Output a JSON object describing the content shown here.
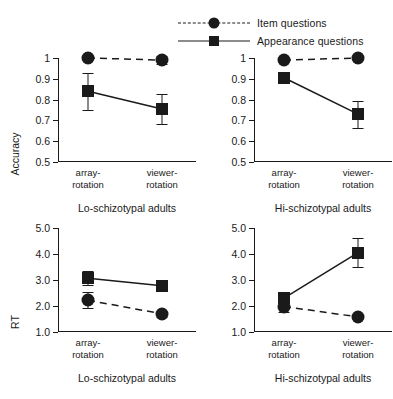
{
  "legend": {
    "position": "top-center",
    "entries": [
      {
        "label": "Item questions",
        "marker": "circle",
        "line": "dashed"
      },
      {
        "label": "Appearance questions",
        "marker": "square",
        "line": "solid"
      }
    ]
  },
  "colors": {
    "ink": "#1a1a1a",
    "background": "#ffffff"
  },
  "chart_data": [
    {
      "type": "line",
      "panel": "top-left",
      "title": "Lo-schizotypal adults",
      "xlabel": "",
      "ylabel": "Accuracy",
      "categories": [
        "array-rotation",
        "viewer-rotation"
      ],
      "ylim": [
        0.5,
        1.0
      ],
      "yticks": [
        "0.5",
        "0.6",
        "0.7",
        "0.8",
        "0.9",
        "1"
      ],
      "grid": false,
      "series": [
        {
          "name": "Item questions",
          "marker": "circle",
          "line": "dashed",
          "values": [
            1.0,
            0.99
          ],
          "errors": [
            0.01,
            0.02
          ]
        },
        {
          "name": "Appearance questions",
          "marker": "square",
          "line": "solid",
          "values": [
            0.84,
            0.755
          ],
          "errors": [
            0.09,
            0.07
          ]
        }
      ]
    },
    {
      "type": "line",
      "panel": "top-right",
      "title": "Hi-schizotypal adults",
      "xlabel": "",
      "ylabel": "",
      "categories": [
        "array-rotation",
        "viewer-rotation"
      ],
      "ylim": [
        0.5,
        1.0
      ],
      "yticks": [
        "0.5",
        "0.6",
        "0.7",
        "0.8",
        "0.9",
        "1"
      ],
      "grid": false,
      "series": [
        {
          "name": "Item questions",
          "marker": "circle",
          "line": "dashed",
          "values": [
            0.99,
            1.0
          ],
          "errors": [
            0.01,
            0.01
          ]
        },
        {
          "name": "Appearance questions",
          "marker": "square",
          "line": "solid",
          "values": [
            0.905,
            0.73
          ],
          "errors": [
            0.015,
            0.065
          ]
        }
      ]
    },
    {
      "type": "line",
      "panel": "bottom-left",
      "title": "Lo-schizotypal adults",
      "xlabel": "",
      "ylabel": "RT",
      "categories": [
        "array-rotation",
        "viewer-rotation"
      ],
      "ylim": [
        1.0,
        5.0
      ],
      "yticks": [
        "1.0",
        "2.0",
        "3.0",
        "4.0",
        "5.0"
      ],
      "grid": false,
      "series": [
        {
          "name": "Item questions",
          "marker": "circle",
          "line": "dashed",
          "values": [
            2.22,
            1.7
          ],
          "errors": [
            0.3,
            0.12
          ]
        },
        {
          "name": "Appearance questions",
          "marker": "square",
          "line": "solid",
          "values": [
            3.07,
            2.78
          ],
          "errors": [
            0.28,
            0.22
          ]
        }
      ]
    },
    {
      "type": "line",
      "panel": "bottom-right",
      "title": "Hi-schizotypal adults",
      "xlabel": "",
      "ylabel": "",
      "categories": [
        "array-rotation",
        "viewer-rotation"
      ],
      "ylim": [
        1.0,
        5.0
      ],
      "yticks": [
        "1.0",
        "2.0",
        "3.0",
        "4.0",
        "5.0"
      ],
      "grid": false,
      "series": [
        {
          "name": "Item questions",
          "marker": "circle",
          "line": "dashed",
          "values": [
            1.98,
            1.58
          ],
          "errors": [
            0.22,
            0.08
          ]
        },
        {
          "name": "Appearance questions",
          "marker": "square",
          "line": "solid",
          "values": [
            2.3,
            4.05
          ],
          "errors": [
            0.18,
            0.55
          ]
        }
      ]
    }
  ]
}
